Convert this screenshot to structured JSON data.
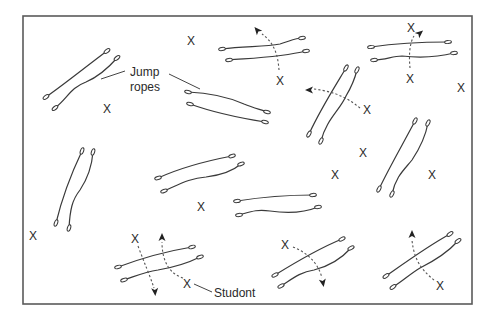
{
  "diagram": {
    "field": {
      "x": 23,
      "y": 16,
      "width": 449,
      "height": 288,
      "border_color": "#5a5a5a"
    },
    "labels": {
      "jump_ropes_line1": "Jump",
      "jump_ropes_line2": "ropes",
      "student": "Studont"
    },
    "student_mark": "X",
    "rope_pairs": [
      {
        "name": "rope-pair-top-left",
        "a": {
          "x1": 46,
          "y1": 97,
          "x2": 107,
          "y2": 51,
          "path": "M46,97 C66,83 88,65 107,51"
        },
        "b": {
          "x1": 55,
          "y1": 108,
          "x2": 117,
          "y2": 58,
          "path": "M55,108 C68,98 70,88 86,82 C100,76 110,66 117,58"
        }
      },
      {
        "name": "rope-pair-upper-center",
        "a": {
          "x1": 188,
          "y1": 92,
          "x2": 267,
          "y2": 112,
          "path": "M188,92 C212,93 228,97 244,104 C254,108 262,110 267,112"
        },
        "b": {
          "x1": 190,
          "y1": 104,
          "x2": 265,
          "y2": 122,
          "path": "M190,104 C212,112 240,118 265,122"
        }
      },
      {
        "name": "rope-pair-top-center",
        "a": {
          "x1": 222,
          "y1": 49,
          "x2": 302,
          "y2": 38,
          "path": "M222,49 C244,46 264,47 280,44 C290,41 296,38 302,38"
        },
        "b": {
          "x1": 229,
          "y1": 60,
          "x2": 306,
          "y2": 51,
          "path": "M229,60 C254,58 282,57 306,51"
        }
      },
      {
        "name": "rope-pair-top-right",
        "a": {
          "x1": 371,
          "y1": 47,
          "x2": 448,
          "y2": 42,
          "path": "M371,47 C398,43 424,42 448,42"
        },
        "b": {
          "x1": 374,
          "y1": 60,
          "x2": 454,
          "y2": 53,
          "path": "M374,60 C386,60 392,56 402,56 C420,58 438,57 454,53"
        }
      },
      {
        "name": "rope-pair-middle-tall",
        "a": {
          "x1": 309,
          "y1": 134,
          "x2": 346,
          "y2": 68,
          "path": "M309,134 C320,110 334,88 346,68"
        },
        "b": {
          "x1": 321,
          "y1": 141,
          "x2": 357,
          "y2": 70,
          "path": "M321,141 C326,120 340,110 346,96 C352,86 355,78 357,70"
        }
      },
      {
        "name": "rope-pair-left-vertical",
        "a": {
          "x1": 56,
          "y1": 223,
          "x2": 82,
          "y2": 151,
          "path": "M56,223 C62,198 72,172 82,151"
        },
        "b": {
          "x1": 69,
          "y1": 228,
          "x2": 93,
          "y2": 152,
          "path": "M69,228 C70,210 72,200 80,190 C88,178 92,165 93,152"
        }
      },
      {
        "name": "rope-pair-center",
        "a": {
          "x1": 158,
          "y1": 178,
          "x2": 232,
          "y2": 156,
          "path": "M158,178 C180,168 206,161 232,156"
        },
        "b": {
          "x1": 164,
          "y1": 191,
          "x2": 241,
          "y2": 164,
          "path": "M164,191 C180,184 190,178 206,177 C222,175 234,170 241,164"
        }
      },
      {
        "name": "rope-pair-right-vertical",
        "a": {
          "x1": 379,
          "y1": 189,
          "x2": 415,
          "y2": 121,
          "path": "M379,189 C390,166 404,142 415,121"
        },
        "b": {
          "x1": 392,
          "y1": 194,
          "x2": 428,
          "y2": 123,
          "path": "M392,194 C396,176 404,170 412,160 C420,148 426,134 428,123"
        }
      },
      {
        "name": "rope-pair-center-lower",
        "a": {
          "x1": 237,
          "y1": 201,
          "x2": 313,
          "y2": 195,
          "path": "M237,201 C262,197 290,195 313,195"
        },
        "b": {
          "x1": 239,
          "y1": 215,
          "x2": 318,
          "y2": 207,
          "path": "M239,215 C250,212 256,209 270,211 C290,214 306,212 318,207"
        }
      },
      {
        "name": "rope-pair-bottom-left",
        "a": {
          "x1": 118,
          "y1": 267,
          "x2": 192,
          "y2": 247,
          "path": "M118,267 C142,258 168,251 192,247"
        },
        "b": {
          "x1": 124,
          "y1": 280,
          "x2": 200,
          "y2": 257,
          "path": "M124,280 C136,276 144,272 158,270 C176,267 190,262 200,257"
        }
      },
      {
        "name": "rope-pair-bottom-center",
        "a": {
          "x1": 275,
          "y1": 275,
          "x2": 342,
          "y2": 239,
          "path": "M275,275 C296,262 320,248 342,239"
        },
        "b": {
          "x1": 281,
          "y1": 286,
          "x2": 351,
          "y2": 248,
          "path": "M281,286 C292,279 300,272 314,270 C330,266 342,258 351,248"
        }
      },
      {
        "name": "rope-pair-bottom-right",
        "a": {
          "x1": 386,
          "y1": 276,
          "x2": 450,
          "y2": 234,
          "path": "M386,276 C406,262 428,246 450,234"
        },
        "b": {
          "x1": 393,
          "y1": 287,
          "x2": 458,
          "y2": 241,
          "path": "M393,287 C404,280 410,274 420,268 C436,260 448,252 458,241"
        }
      }
    ],
    "students": [
      {
        "name": "student-top-1",
        "x": 191,
        "y": 41
      },
      {
        "name": "student-top-left",
        "x": 107,
        "y": 109
      },
      {
        "name": "student-top-center-mover",
        "x": 280,
        "y": 81
      },
      {
        "name": "student-top-right-lead",
        "x": 411,
        "y": 28
      },
      {
        "name": "student-top-right-mover",
        "x": 410,
        "y": 79
      },
      {
        "name": "student-far-right-upper",
        "x": 461,
        "y": 88
      },
      {
        "name": "student-middle-mover",
        "x": 367,
        "y": 110
      },
      {
        "name": "student-middle-right",
        "x": 363,
        "y": 153
      },
      {
        "name": "student-center-right",
        "x": 335,
        "y": 175
      },
      {
        "name": "student-right-edge",
        "x": 432,
        "y": 175
      },
      {
        "name": "student-center",
        "x": 201,
        "y": 207
      },
      {
        "name": "student-left-edge",
        "x": 33,
        "y": 236
      },
      {
        "name": "student-bottom-left-a",
        "x": 135,
        "y": 239
      },
      {
        "name": "student-bottom-left-b",
        "x": 187,
        "y": 284
      },
      {
        "name": "student-bottom-center",
        "x": 285,
        "y": 245
      },
      {
        "name": "student-bottom-right",
        "x": 440,
        "y": 286
      }
    ],
    "movement_paths": [
      {
        "name": "path-top-center",
        "d": "M279,70 C278,58 276,44 262,34",
        "arrow": {
          "x": 257,
          "y": 30,
          "angle": -130
        }
      },
      {
        "name": "path-top-right",
        "d": "M410,68 C409,58 409,44 414,36",
        "arrow": {
          "x": 420,
          "y": 33,
          "angle": -40
        }
      },
      {
        "name": "path-middle",
        "d": "M360,108 C350,100 338,92 314,89",
        "arrow": {
          "x": 309,
          "y": 90,
          "angle": 180
        }
      },
      {
        "name": "path-bottom-left-a",
        "d": "M138,246 C144,262 150,276 154,288",
        "arrow": {
          "x": 155,
          "y": 292,
          "angle": 85
        }
      },
      {
        "name": "path-bottom-left-b",
        "d": "M183,278 C170,274 162,262 162,242",
        "arrow": {
          "x": 162,
          "y": 237,
          "angle": -90
        }
      },
      {
        "name": "path-bottom-center",
        "d": "M293,247 C306,252 318,262 322,278",
        "arrow": {
          "x": 323,
          "y": 283,
          "angle": 80
        }
      },
      {
        "name": "path-bottom-right",
        "d": "M434,280 C424,272 414,262 412,240",
        "arrow": {
          "x": 412,
          "y": 234,
          "angle": -90
        }
      }
    ],
    "leaders": [
      {
        "name": "leader-jump-ropes-left",
        "x1": 101,
        "y1": 79,
        "x2": 125,
        "y2": 71
      },
      {
        "name": "leader-jump-ropes-right",
        "x1": 169,
        "y1": 74,
        "x2": 200,
        "y2": 89
      },
      {
        "name": "leader-student",
        "x1": 194,
        "y1": 284,
        "x2": 212,
        "y2": 292
      }
    ],
    "label_positions": {
      "jump_ropes_line1": {
        "x": 130,
        "y": 76
      },
      "jump_ropes_line2": {
        "x": 130,
        "y": 91
      },
      "student": {
        "x": 214,
        "y": 297
      }
    }
  }
}
